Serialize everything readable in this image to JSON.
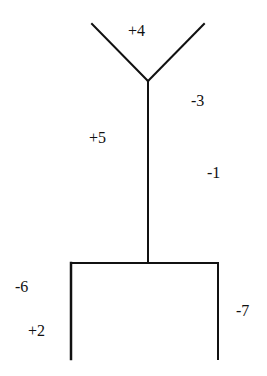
{
  "diagram": {
    "type": "tree",
    "line_color": "#111111",
    "labels": {
      "top": "+4",
      "upper_right": "-3",
      "stem_left": "+5",
      "stem_right": "-1",
      "lower_left_outer": "-6",
      "lower_left_inner": "+2",
      "lower_right": "-7"
    }
  }
}
